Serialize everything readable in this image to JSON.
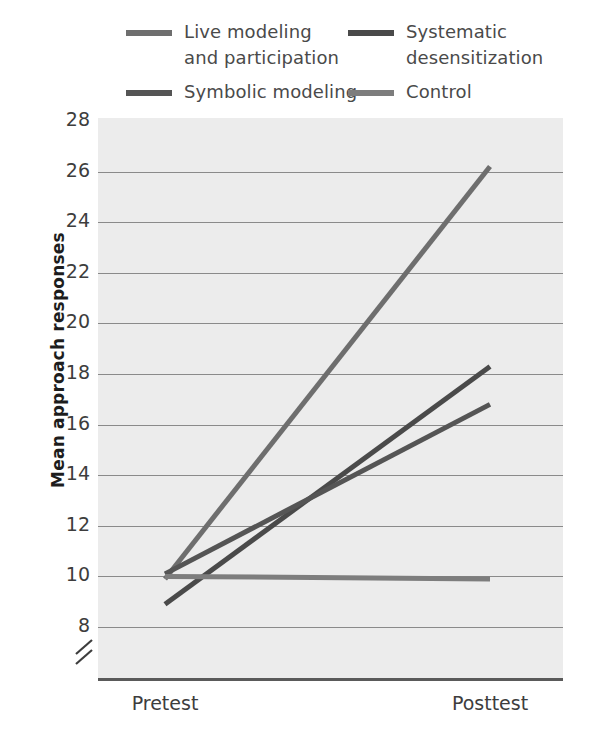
{
  "legend": {
    "items": [
      {
        "label": "Live modeling\nand participation",
        "color": "#6e6e6e",
        "key": "live-modeling-and-participation"
      },
      {
        "label": "Systematic\ndesensitization",
        "color": "#4a4a4a",
        "key": "systematic-desensitization"
      },
      {
        "label": "Symbolic modeling",
        "color": "#555555",
        "key": "symbolic-modeling"
      },
      {
        "label": "Control",
        "color": "#7d7d7d",
        "key": "control"
      }
    ]
  },
  "axes": {
    "y_title": "Mean approach responses",
    "y_ticks": [
      "28",
      "26",
      "24",
      "22",
      "20",
      "18",
      "16",
      "14",
      "12",
      "10",
      "8"
    ],
    "x_ticks": [
      "Pretest",
      "Posttest"
    ],
    "break_symbol": "//"
  },
  "chart_data": {
    "type": "line",
    "title": "",
    "xlabel": "",
    "ylabel": "Mean approach responses",
    "categories": [
      "Pretest",
      "Posttest"
    ],
    "x": [
      0,
      1
    ],
    "ylim": [
      8,
      28
    ],
    "yticks": [
      8,
      10,
      12,
      14,
      16,
      18,
      20,
      22,
      24,
      26,
      28
    ],
    "ytick_step": 2,
    "grid": true,
    "axis_break": true,
    "legend_position": "top",
    "series": [
      {
        "name": "Live modeling and participation",
        "values": [
          9.9,
          26.2
        ],
        "color": "#6e6e6e"
      },
      {
        "name": "Systematic desensitization",
        "values": [
          8.9,
          18.3
        ],
        "color": "#4a4a4a"
      },
      {
        "name": "Symbolic modeling",
        "values": [
          10.1,
          16.8
        ],
        "color": "#555555"
      },
      {
        "name": "Control",
        "values": [
          10.0,
          9.9
        ],
        "color": "#7d7d7d"
      }
    ]
  },
  "colors": {
    "plot_background": "#ececec",
    "gridline": "#8a8a8a",
    "axis": "#5a5a5a",
    "text": "#3d3d3d"
  }
}
